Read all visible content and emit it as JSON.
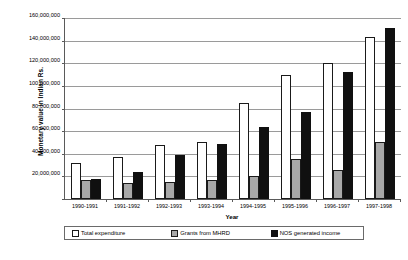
{
  "chart_data": {
    "type": "bar",
    "title": "",
    "xlabel": "Year",
    "ylabel": "Monetary value in Indian Rs.",
    "categories": [
      "1990-1991",
      "1991-1992",
      "1992-1993",
      "1993-1994",
      "1994-1995",
      "1995-1996",
      "1996-1997",
      "1997-1998"
    ],
    "series": [
      {
        "name": "Total expenditure",
        "color": "#ffffff",
        "values": [
          32000000,
          37000000,
          48000000,
          50000000,
          85000000,
          110000000,
          120000000,
          143000000
        ]
      },
      {
        "name": "Grants from MHRD",
        "color": "#a8a8a8",
        "values": [
          17000000,
          14000000,
          15000000,
          17000000,
          20000000,
          35000000,
          26000000,
          50000000
        ]
      },
      {
        "name": "NOS generated income",
        "color": "#101010",
        "values": [
          18000000,
          24000000,
          39000000,
          49000000,
          64000000,
          77000000,
          112000000,
          151000000
        ]
      }
    ],
    "ylim": [
      0,
      160000000
    ],
    "ytick_values": [
      0,
      20000000,
      40000000,
      60000000,
      80000000,
      100000000,
      120000000,
      140000000,
      160000000
    ],
    "ytick_labels": [
      "0",
      "20,000,000",
      "40,000,000",
      "60,000,000",
      "80,000,000",
      "100,000,000",
      "120,000,000",
      "140,000,000",
      "160,000,000"
    ],
    "grid": true,
    "legend_position": "bottom"
  },
  "legend": {
    "items": [
      {
        "label": "Total expenditure",
        "swatch": "legend-swatch-white"
      },
      {
        "label": "Grants from MHRD",
        "swatch": "legend-swatch-gray"
      },
      {
        "label": "NOS generated income",
        "swatch": "legend-swatch-black"
      }
    ]
  }
}
